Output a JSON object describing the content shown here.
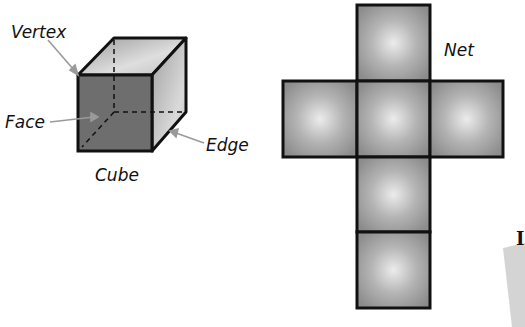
{
  "cube": {
    "title": "Cube",
    "labels": {
      "vertex": "Vertex",
      "face": "Face",
      "edge": "Edge"
    }
  },
  "net": {
    "title": "Net",
    "squares": 6
  },
  "partial_card": {
    "visible_text": "I"
  },
  "colors": {
    "front_face": "#6e6e6e",
    "top_face": "#c8c8c8",
    "side_face": "#a8a8a8",
    "net_square": "#9a9a9a",
    "net_highlight": "#e6e6e6",
    "outline": "#111111",
    "arrow": "#9a9a9a"
  }
}
